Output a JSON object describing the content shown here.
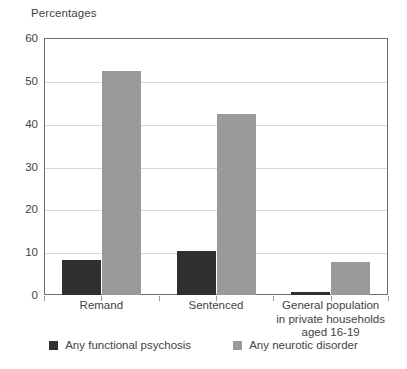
{
  "chart_data": {
    "type": "bar",
    "title": "Percentages",
    "xlabel": "",
    "ylabel": "",
    "ylim": [
      0,
      60
    ],
    "yticks": [
      0,
      10,
      20,
      30,
      40,
      50,
      60
    ],
    "grid": true,
    "legend_position": "bottom",
    "categories": [
      "Remand",
      "Sentenced",
      "General population\nin private households\naged 16-19"
    ],
    "category_lines": [
      [
        "Remand"
      ],
      [
        "Sentenced"
      ],
      [
        "General population",
        "in private households",
        "aged 16-19"
      ]
    ],
    "series": [
      {
        "name": "Any functional psychosis",
        "color": "#2f2f2f",
        "values": [
          8.2,
          10.3,
          0.6
        ]
      },
      {
        "name": "Any neurotic disorder",
        "color": "#9a9a9a",
        "values": [
          52.2,
          42.2,
          7.6
        ]
      }
    ]
  },
  "legend": {
    "items": [
      {
        "label": "Any functional psychosis",
        "color": "#2f2f2f"
      },
      {
        "label": "Any neurotic disorder",
        "color": "#9a9a9a"
      }
    ]
  },
  "axes": {
    "y_tick_labels": [
      "0",
      "10",
      "20",
      "30",
      "40",
      "50",
      "60"
    ]
  },
  "colors": {
    "dark_series": "#2f2f2f",
    "light_series": "#9a9a9a",
    "gridline": "#d8d8d8",
    "axis_border": "#6d6d6d",
    "text": "#3f3f3f",
    "background": "#ffffff"
  }
}
